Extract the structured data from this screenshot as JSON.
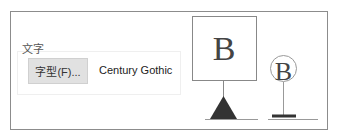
{
  "text_group": {
    "label": "文字",
    "font_button_label": "字型(F)...",
    "current_font": "Century Gothic"
  },
  "preview": {
    "large_glyph": "B",
    "small_glyph": "B",
    "icons": [
      "anchor-box-icon",
      "triangle-anchor-icon",
      "circled-glyph-icon",
      "bar-anchor-icon"
    ]
  },
  "colors": {
    "frame_border": "#8c8c8c",
    "button_bg": "#e1e1e1",
    "marker_fill": "#333333"
  }
}
